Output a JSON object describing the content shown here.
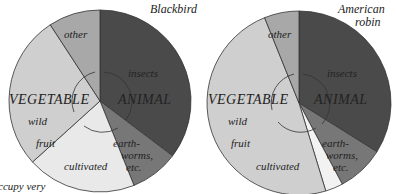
{
  "chart_data": [
    {
      "type": "pie",
      "title": "Blackbird",
      "groups": [
        "ANIMAL",
        "VEGETABLE"
      ],
      "slices": [
        {
          "label": "insects",
          "group": "ANIMAL",
          "value": 35.3,
          "color": "#4a4a4a"
        },
        {
          "label": "earth-worms, etc.",
          "group": "ANIMAL",
          "value": 8.6,
          "color": "#777777"
        },
        {
          "label": "cultivated",
          "group": "VEGETABLE",
          "value": 19.4,
          "color": "#e9e9e9"
        },
        {
          "label": "wild fruit",
          "group": "VEGETABLE",
          "value": 27.5,
          "color": "#cfcfcf"
        },
        {
          "label": "other",
          "group": "VEGETABLE",
          "value": 9.2,
          "color": "#a8a8a8"
        }
      ]
    },
    {
      "type": "pie",
      "title": "American robin",
      "groups": [
        "ANIMAL",
        "VEGETABLE"
      ],
      "slices": [
        {
          "label": "insects",
          "group": "ANIMAL",
          "value": 33.9,
          "color": "#4a4a4a"
        },
        {
          "label": "earth-worms, etc.",
          "group": "ANIMAL",
          "value": 8.3,
          "color": "#777777"
        },
        {
          "label": "cultivated",
          "group": "VEGETABLE",
          "value": 3.1,
          "color": "#f2f2f2"
        },
        {
          "label": "wild fruit",
          "group": "VEGETABLE",
          "value": 48.6,
          "color": "#cfcfcf"
        },
        {
          "label": "other",
          "group": "VEGETABLE",
          "value": 6.1,
          "color": "#a8a8a8"
        }
      ]
    }
  ],
  "labels": {
    "left_title": "Blackbird",
    "right_title_1": "American",
    "right_title_2": "robin",
    "animal": "ANIMAL",
    "vegetable": "VEGETABLE",
    "insects": "insects",
    "earth1": "earth-",
    "earth2": "worms,",
    "earth3": "etc.",
    "wild": "wild",
    "fruit": "fruit",
    "cultivated": "cultivated",
    "other": "other",
    "caption_fragment": "ccupy very"
  }
}
